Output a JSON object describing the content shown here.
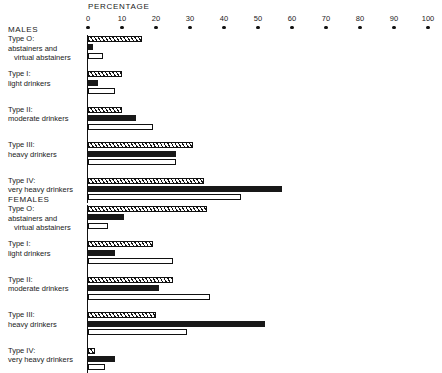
{
  "chart_data": {
    "type": "bar",
    "title": "",
    "xlabel": "PERCENTAGE",
    "ylabel": "",
    "orientation": "horizontal",
    "grid": false,
    "legend": "none",
    "xlim": [
      0,
      100
    ],
    "xticks": [
      0,
      10,
      20,
      30,
      40,
      50,
      60,
      70,
      80,
      90,
      100
    ],
    "xticklabels": [
      "0",
      "10",
      "20",
      "30",
      "40",
      "50",
      "60",
      "70",
      "80",
      "90",
      "100"
    ],
    "series": [
      {
        "name": "series-1",
        "style": "hatched"
      },
      {
        "name": "series-2",
        "style": "solid-black"
      },
      {
        "name": "series-3",
        "style": "open-white"
      }
    ],
    "groups": [
      {
        "name": "MALES",
        "categories": [
          {
            "label": "Type O:",
            "desc1": "abstainers and",
            "desc2": "virtual abstainers",
            "values": [
              16,
              1.5,
              4.5
            ]
          },
          {
            "label": "Type I:",
            "desc1": "light drinkers",
            "desc2": "",
            "values": [
              10,
              3,
              8
            ]
          },
          {
            "label": "Type II:",
            "desc1": "moderate drinkers",
            "desc2": "",
            "values": [
              10,
              14,
              19
            ]
          },
          {
            "label": "Type III:",
            "desc1": "heavy drinkers",
            "desc2": "",
            "values": [
              31,
              26,
              26
            ]
          },
          {
            "label": "Type IV:",
            "desc1": "very heavy drinkers",
            "desc2": "",
            "values": [
              34,
              57,
              45
            ]
          }
        ]
      },
      {
        "name": "FEMALES",
        "categories": [
          {
            "label": "Type O:",
            "desc1": "abstainers and",
            "desc2": "virtual abstainers",
            "values": [
              35,
              10.5,
              6
            ]
          },
          {
            "label": "Type I:",
            "desc1": "light drinkers",
            "desc2": "",
            "values": [
              19,
              8,
              25
            ]
          },
          {
            "label": "Type II:",
            "desc1": "moderate drinkers",
            "desc2": "",
            "values": [
              25,
              21,
              36
            ]
          },
          {
            "label": "Type III:",
            "desc1": "heavy drinkers",
            "desc2": "",
            "values": [
              20,
              52,
              29
            ]
          },
          {
            "label": "Type IV:",
            "desc1": "very heavy drinkers",
            "desc2": "",
            "values": [
              2,
              8,
              5
            ]
          }
        ]
      }
    ]
  }
}
